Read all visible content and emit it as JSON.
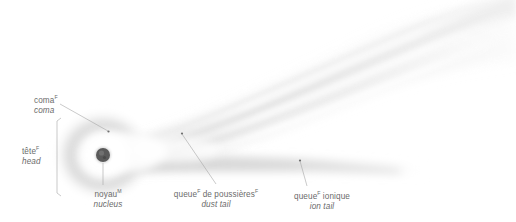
{
  "figure": {
    "background_color": "#ffffff",
    "text_color": "#6b6b6b",
    "nucleus_color": "#555555",
    "leader_color": "#9a9a9a",
    "coma_color": "#dcdcdc",
    "tail_color": "#e9e9e9"
  },
  "labels": {
    "coma": {
      "fr": "coma",
      "sup": "F",
      "en": "coma"
    },
    "head": {
      "fr": "tête",
      "sup": "F",
      "en": "head"
    },
    "nucleus": {
      "fr": "noyau",
      "sup": "M",
      "en": "nucleus"
    },
    "dust_tail": {
      "fr": "queue",
      "sup": "F",
      "fr2": " de poussières",
      "sup2": "F",
      "en": "dust tail"
    },
    "ion_tail": {
      "fr": "queue",
      "sup": "F",
      "fr2": " ionique",
      "en": "ion tail"
    }
  },
  "diagram_parts": [
    {
      "name": "nucleus",
      "cx": 103,
      "cy": 155,
      "r": 7
    },
    {
      "name": "coma",
      "cx": 103,
      "cy": 155,
      "rx": 46,
      "ry": 42
    },
    {
      "name": "dust-tail",
      "direction": "upper-right",
      "streaks": 7
    },
    {
      "name": "ion-tail",
      "direction": "right"
    },
    {
      "name": "head-bracket",
      "x": 57,
      "y1": 118,
      "y2": 196
    }
  ],
  "leaders": [
    {
      "name": "coma-leader",
      "x1": 60,
      "y1": 104,
      "x2": 108,
      "y2": 131
    },
    {
      "name": "nucleus-leader",
      "x1": 103,
      "y1": 162,
      "x2": 103,
      "y2": 186
    },
    {
      "name": "dust-leader",
      "x1": 182,
      "y1": 134,
      "x2": 216,
      "y2": 185
    },
    {
      "name": "ion-leader",
      "x1": 300,
      "y1": 161,
      "x2": 307,
      "y2": 187
    }
  ]
}
